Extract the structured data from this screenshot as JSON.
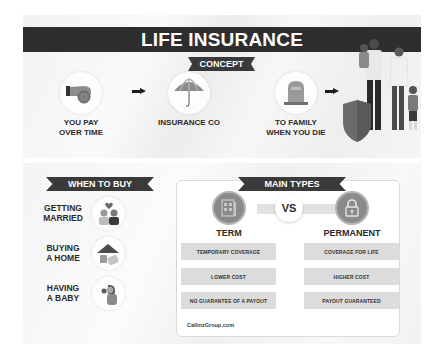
{
  "title": "LIFE INSURANCE",
  "concept": {
    "ribbon": "CONCEPT",
    "steps": [
      {
        "label_line1": "YOU PAY",
        "label_line2": "OVER TIME",
        "icon": "hand-coin-icon"
      },
      {
        "label_line1": "INSURANCE CO",
        "label_line2": "",
        "icon": "umbrella-icon"
      },
      {
        "label_line1": "TO FAMILY",
        "label_line2": "WHEN YOU DIE",
        "icon": "tombstone-icon"
      }
    ],
    "family_icon": "family-shield-icon"
  },
  "when_to_buy": {
    "ribbon": "WHEN TO BUY",
    "items": [
      {
        "label_line1": "GETTING",
        "label_line2": "MARRIED",
        "icon": "couple-icon"
      },
      {
        "label_line1": "BUYING",
        "label_line2": "A HOME",
        "icon": "house-icon"
      },
      {
        "label_line1": "HAVING",
        "label_line2": "A BABY",
        "icon": "mother-baby-icon"
      }
    ]
  },
  "main_types": {
    "ribbon": "MAIN TYPES",
    "vs": "VS",
    "term": {
      "title": "TERM",
      "icon": "calendar-document-icon",
      "features": [
        "TEMPORARY COVERAGE",
        "LOWER COST",
        "NO GUARANTEE OF A PAYOUT"
      ]
    },
    "permanent": {
      "title": "PERMANENT",
      "icon": "lock-icon",
      "features": [
        "COVERAGE FOR LIFE",
        "HIGHER COST",
        "PAYOUT GUARANTEED"
      ]
    }
  },
  "footer": "CallinzGroup.com"
}
